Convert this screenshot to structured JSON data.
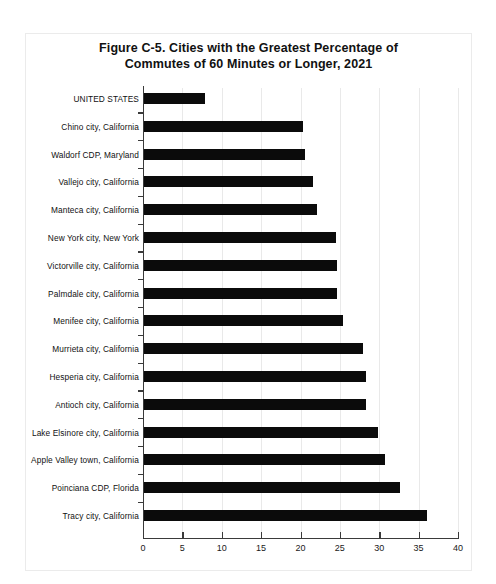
{
  "figure": {
    "title_line1": "Figure C-5. Cities with the Greatest Percentage of",
    "title_line2": "Commutes of 60 Minutes or Longer, 2021"
  },
  "chart_data": {
    "type": "bar",
    "orientation": "horizontal",
    "title": "Figure C-5. Cities with the Greatest Percentage of Commutes of 60 Minutes or Longer, 2021",
    "xlabel": "",
    "ylabel": "",
    "xlim": [
      0,
      40
    ],
    "xticks": [
      0,
      5,
      10,
      15,
      20,
      25,
      30,
      35,
      40
    ],
    "xtick_labels": [
      "0",
      "5",
      "10",
      "15",
      "20",
      "25",
      "30",
      "35",
      "40"
    ],
    "grid": true,
    "legend": "none",
    "bar_color": "#0b0b0b",
    "categories": [
      "UNITED STATES",
      "Chino city, California",
      "Waldorf CDP, Maryland",
      "Vallejo city, California",
      "Manteca city, California",
      "New York city, New York",
      "Victorville city, California",
      "Palmdale city, California",
      "Menifee city, California",
      "Murrieta city, California",
      "Hesperia city, California",
      "Antioch city, California",
      "Lake Elsinore city, California",
      "Apple Valley town, California",
      "Poinciana CDP, Florida",
      "Tracy city, California"
    ],
    "values": [
      7.9,
      20.3,
      20.6,
      21.6,
      22.1,
      24.5,
      24.6,
      24.6,
      25.4,
      27.9,
      28.3,
      28.3,
      29.8,
      30.7,
      32.6,
      36.1
    ]
  }
}
